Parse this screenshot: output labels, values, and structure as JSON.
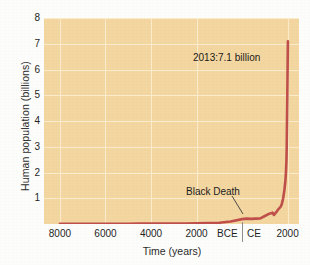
{
  "chart_data": {
    "type": "line",
    "title": "",
    "xlabel": "Time (years)",
    "ylabel": "Human population (billions)",
    "ylim": [
      0,
      8
    ],
    "yticks": [
      8,
      7,
      6,
      5,
      4,
      3,
      2,
      1
    ],
    "xticks": [
      "8000",
      "6000",
      "4000",
      "2000",
      "BCE",
      "CE",
      "2000"
    ],
    "xtick_note": "years BCE decreasing to the BCE/CE boundary, then years CE increasing",
    "grid": true,
    "legend": "none",
    "series": [
      {
        "name": "Human population",
        "color": "#bf4f4a",
        "x": [
          -8000,
          -7000,
          -6000,
          -5500,
          -5000,
          -4500,
          -4000,
          -3000,
          -2500,
          -2000,
          -1500,
          -1000,
          -500,
          0,
          200,
          400,
          600,
          800,
          1000,
          1200,
          1300,
          1340,
          1400,
          1500,
          1600,
          1700,
          1750,
          1800,
          1850,
          1900,
          1927,
          1950,
          1960,
          1974,
          1987,
          1999,
          2011,
          2013
        ],
        "values": [
          0.005,
          0.006,
          0.007,
          0.012,
          0.012,
          0.013,
          0.013,
          0.014,
          0.02,
          0.027,
          0.035,
          0.05,
          0.1,
          0.19,
          0.21,
          0.2,
          0.21,
          0.22,
          0.31,
          0.4,
          0.43,
          0.44,
          0.35,
          0.46,
          0.58,
          0.68,
          0.79,
          0.98,
          1.26,
          1.65,
          2.0,
          2.5,
          3.0,
          4.0,
          5.0,
          6.0,
          7.0,
          7.1
        ]
      }
    ],
    "annotations": [
      {
        "id": "population-2013",
        "text": "2013:7.1 billion",
        "points_to": "curve endpoint at 2013"
      },
      {
        "id": "black-death",
        "text": "Black Death",
        "points_to": "population dip around 1400 CE",
        "leader_line": true
      }
    ],
    "colors": {
      "plot_background": "#f3d6a0",
      "gridline": "#fbeccd",
      "curve": "#bf4f4a",
      "text": "#1f1f1f",
      "page_background": "#fdfdfb",
      "era_divider": "#8d8d8d"
    }
  }
}
